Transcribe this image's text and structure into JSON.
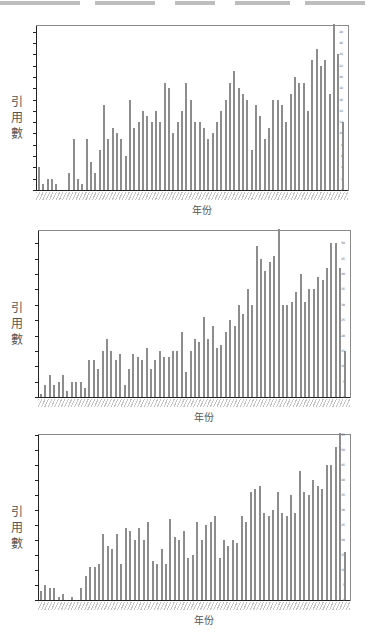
{
  "chart_data": [
    {
      "type": "bar",
      "title": "",
      "xlabel": "年份",
      "ylabel": "引用數",
      "ylim": [
        0,
        29
      ],
      "yticks": [
        0,
        2,
        4,
        6,
        8,
        10,
        12,
        14,
        16,
        18,
        20,
        22,
        24,
        26,
        28
      ],
      "grid": false,
      "legend": null,
      "values": [
        4,
        1,
        2,
        2,
        1,
        0,
        0,
        3,
        9,
        2,
        1,
        9,
        5,
        3,
        7,
        15,
        9,
        11,
        10,
        9,
        6,
        16,
        11,
        12,
        14,
        13,
        12,
        14,
        12,
        19,
        18,
        10,
        12,
        14,
        19,
        16,
        12,
        12,
        11,
        9,
        10,
        12,
        14,
        16,
        19,
        21,
        18,
        17,
        16,
        7,
        15,
        13,
        9,
        11,
        16,
        16,
        15,
        12,
        17,
        20,
        19,
        19,
        14,
        23,
        25,
        22,
        23,
        17,
        29,
        24,
        12
      ]
    },
    {
      "type": "bar",
      "title": "",
      "xlabel": "年份",
      "ylabel": "引用數",
      "ylim": [
        0,
        54
      ],
      "yticks": [
        0,
        5,
        10,
        15,
        20,
        25,
        30,
        35,
        40,
        45,
        50
      ],
      "grid": false,
      "legend": null,
      "values": [
        1,
        4,
        7,
        4,
        5,
        7,
        2,
        5,
        5,
        5,
        3,
        12,
        12,
        9,
        15,
        19,
        15,
        12,
        14,
        4,
        9,
        14,
        13,
        12,
        16,
        9,
        12,
        15,
        13,
        13,
        15,
        15,
        21,
        8,
        15,
        19,
        18,
        26,
        19,
        23,
        16,
        17,
        21,
        25,
        23,
        30,
        27,
        35,
        30,
        49,
        45,
        41,
        44,
        46,
        54,
        30,
        30,
        31,
        34,
        40,
        31,
        35,
        35,
        39,
        38,
        42,
        50,
        50,
        42,
        15
      ]
    },
    {
      "type": "bar",
      "title": "",
      "xlabel": "年份",
      "ylabel": "引用數",
      "ylim": [
        0,
        55
      ],
      "yticks": [
        0,
        5,
        10,
        15,
        20,
        25,
        30,
        35,
        40,
        45,
        50,
        55
      ],
      "grid": false,
      "legend": null,
      "values": [
        3,
        5,
        4,
        4,
        1,
        2,
        0,
        1,
        0,
        4,
        8,
        11,
        11,
        12,
        22,
        18,
        17,
        22,
        12,
        24,
        23,
        20,
        24,
        20,
        26,
        13,
        12,
        17,
        12,
        27,
        21,
        20,
        23,
        14,
        15,
        26,
        20,
        25,
        26,
        28,
        14,
        20,
        18,
        20,
        19,
        28,
        26,
        36,
        37,
        38,
        29,
        28,
        30,
        36,
        29,
        28,
        35,
        29,
        43,
        36,
        35,
        40,
        38,
        37,
        45,
        45,
        51,
        55,
        16
      ]
    }
  ],
  "axis_labels": {
    "ylabel_chars": [
      "引",
      "用",
      "數"
    ],
    "xlabel": "年份"
  }
}
